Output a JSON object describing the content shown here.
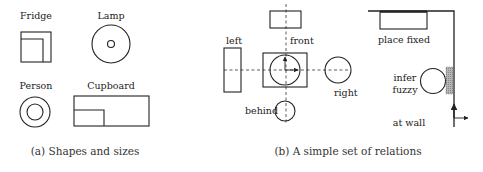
{
  "panel_a": {
    "caption": "(a) Shapes and sizes",
    "labels": {
      "fridge": "Fridge",
      "lamp": "Lamp",
      "person": "Person",
      "cupboard": "Cupboard"
    }
  },
  "panel_b": {
    "caption": "(b) A simple set of relations",
    "labels": {
      "left": "left",
      "front": "front",
      "right": "right",
      "behind": "behind"
    }
  },
  "panel_c": {
    "labels": {
      "place_fixed": "place fixed",
      "infer": "infer",
      "fuzzy": "fuzzy",
      "at_wall": "at wall"
    },
    "colors": {
      "fuzzy_region": "#9a9a9a"
    }
  }
}
